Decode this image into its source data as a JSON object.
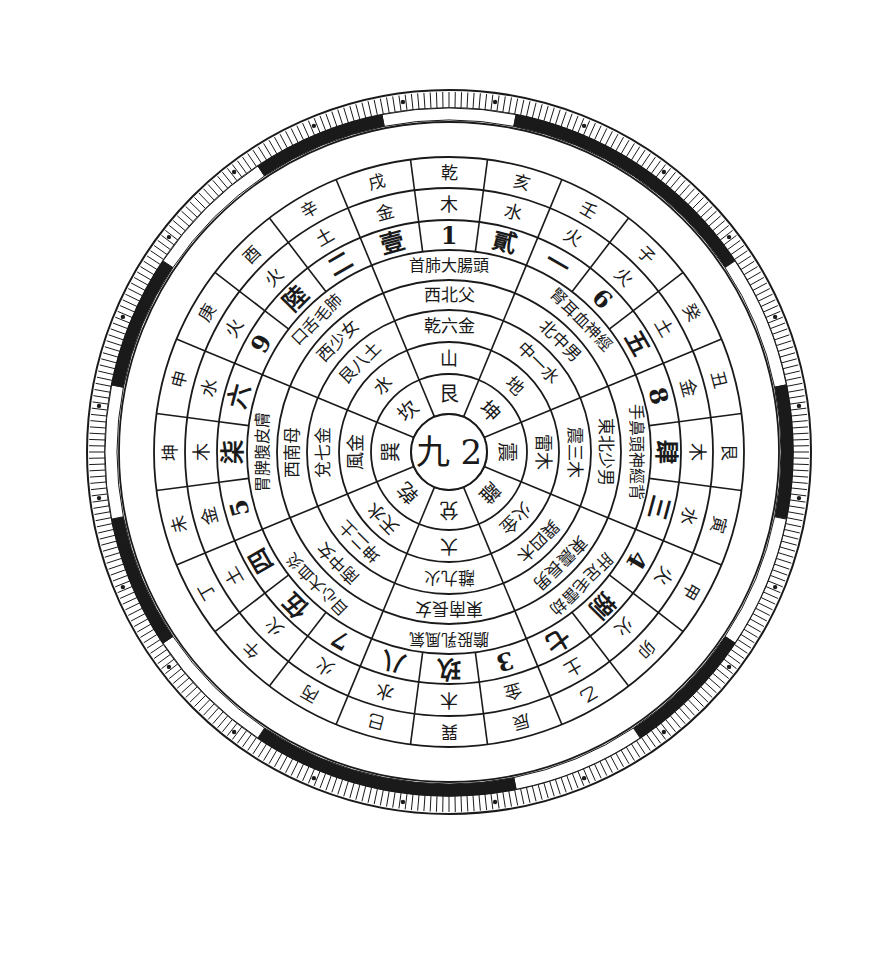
{
  "title": "",
  "center": {
    "label": "九 2"
  },
  "geometry": {
    "cx": 449,
    "cy": 452,
    "ring_radii": [
      38,
      78,
      110,
      142,
      172,
      202,
      232,
      264,
      295,
      330
    ],
    "tick_outer": 362,
    "tick_inner": 344,
    "border_r": 332
  },
  "colors": {
    "ink": "#1a1a1a",
    "paper": "#ffffff"
  },
  "chart_data": {
    "type": "table",
    "layout": "concentric-rings",
    "center": [
      "九",
      "2"
    ],
    "rings": [
      {
        "name": "ring-1-trigrams",
        "start_deg": -90,
        "sectors": 8,
        "cells": [
          "艮",
          "坤",
          "震",
          "離",
          "兌",
          "乾",
          "巽",
          "坎"
        ]
      },
      {
        "name": "ring-2-elements",
        "start_deg": -90,
        "sectors": 8,
        "cells": [
          "山",
          "地",
          "雷",
          "火金",
          "澤大",
          "天水",
          "風金",
          "水水"
        ]
      },
      {
        "name": "ring-3",
        "start_deg": -90,
        "sectors": 8,
        "cells": [
          "乾六金",
          "一水",
          "木",
          "三木",
          "巽四木",
          "離九火",
          "坤二土",
          "兌七金"
        ]
      },
      {
        "name": "ring-4-directions",
        "start_deg": -90,
        "sectors": 8,
        "cells": [
          "西北父",
          "中男",
          "艮八土",
          "東震長",
          "東南長女",
          "南中女",
          "西南母",
          "西少女"
        ]
      },
      {
        "name": "ring-5-body",
        "start_deg": -90,
        "sectors": 8,
        "cells": [
          "首肺大腸頭",
          "神經",
          "東北少男",
          "雷劫",
          "氣風乳股膽",
          "目心大血炎",
          "腹皮膚",
          "口舌"
        ]
      },
      {
        "name": "ring-6-numbers",
        "start_deg": -90,
        "sectors": 12,
        "cells": [
          "1",
          "6",
          "五",
          "8",
          "三",
          "4",
          "七",
          "3 八",
          "7",
          "四",
          "5",
          "六 9"
        ]
      },
      {
        "name": "ring-7-stems",
        "start_deg": -90,
        "sectors": 16,
        "cells": [
          "壹",
          "一",
          "貳",
          "捌",
          "肆",
          "三",
          "捌",
          "七",
          "玖",
          "八",
          "伍",
          "四",
          "柒",
          "六",
          "陸",
          "二"
        ]
      },
      {
        "name": "ring-8-elements-outer",
        "start_deg": -90,
        "sectors": 16,
        "cells": [
          "木",
          "水",
          "火",
          "土",
          "金",
          "木",
          "水",
          "火",
          "土",
          "木",
          "水",
          "火",
          "土",
          "金",
          "木",
          "土"
        ]
      },
      {
        "name": "ring-9-mountains",
        "start_deg": -90,
        "sectors": 24,
        "cells": [
          "乾",
          "亥",
          "壬",
          "子",
          "癸",
          "丑",
          "艮",
          "寅",
          "甲",
          "卯",
          "乙",
          "辰",
          "巽",
          "巳",
          "丙",
          "午",
          "丁",
          "未",
          "坤",
          "申",
          "庚",
          "酉",
          "辛",
          "戌"
        ]
      }
    ],
    "outer_band_pattern": [
      "white",
      "black",
      "black",
      "white",
      "black",
      "white",
      "black",
      "white",
      "black",
      "black",
      "white",
      "black",
      "white",
      "black",
      "white",
      "black"
    ],
    "tick_count": 360
  },
  "labels": {
    "r1": [
      "艮",
      "坤",
      "震",
      "離",
      "兌",
      "乾",
      "巽",
      "坎"
    ],
    "r2": [
      "山",
      "地",
      "雷木",
      "火金",
      "大",
      "天水",
      "風金",
      "水"
    ],
    "r3": [
      "乾六金",
      "中一水",
      "震三木",
      "巽四木",
      "離九火",
      "坤二土",
      "兌七金",
      "艮八土"
    ],
    "r4": [
      "西北父",
      "北中男",
      "東北少男",
      "東震長男",
      "東南長女",
      "南中女",
      "西南母",
      "西少女"
    ],
    "r5": [
      "首肺大腸頭",
      "腎耳血神經",
      "手鼻頭神經背",
      "肝足毛雷劫",
      "膽股乳風氣",
      "目心大血炎",
      "胃脾腹皮膚",
      "口舌毛肺"
    ],
    "r6": [
      "1",
      "貳",
      "一",
      "6",
      "五",
      "8",
      "肆",
      "三",
      "4",
      "捌",
      "七",
      "3",
      "玖",
      "八",
      "7",
      "伍",
      "四",
      "5",
      "柒",
      "六",
      "9",
      "陸",
      "二",
      "壹"
    ],
    "r7": [
      "木",
      "水",
      "火",
      "火",
      "土",
      "金",
      "木",
      "水",
      "火",
      "火",
      "土",
      "金",
      "木",
      "水",
      "火",
      "火",
      "土",
      "金",
      "木",
      "水",
      "火",
      "火",
      "土",
      "金"
    ],
    "r8": [
      "乾",
      "亥",
      "壬",
      "子",
      "癸",
      "丑",
      "艮",
      "寅",
      "甲",
      "卯",
      "乙",
      "辰",
      "巽",
      "巳",
      "丙",
      "午",
      "丁",
      "未",
      "坤",
      "申",
      "庚",
      "酉",
      "辛",
      "戌"
    ]
  }
}
